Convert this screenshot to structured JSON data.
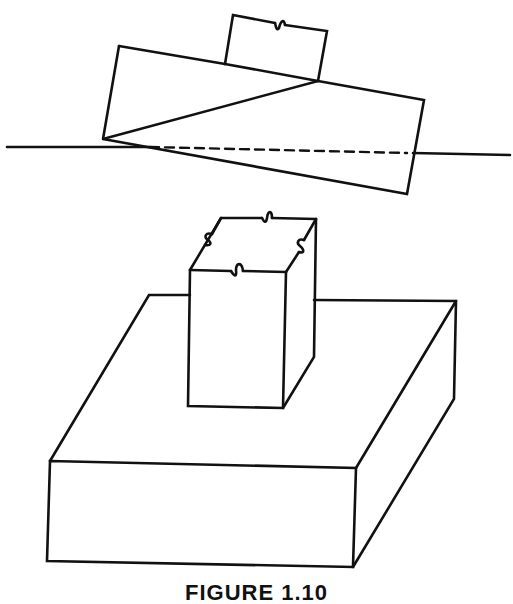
{
  "figure": {
    "caption": "FIGURE 1.10",
    "stroke_color": "#111111",
    "background": "#ffffff",
    "elements": [
      {
        "name": "horizon-line",
        "style": "solid-dashed-solid"
      },
      {
        "name": "tilted-footing-on-water",
        "description": "large rectangle tilted clockwise with small block on top"
      },
      {
        "name": "pier-column",
        "description": "square column with wavy break marks on top face"
      },
      {
        "name": "spread-footing-base",
        "description": "wide rectangular slab"
      }
    ]
  }
}
